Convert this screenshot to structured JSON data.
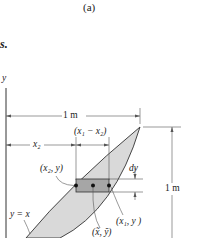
{
  "figure": {
    "caption": "(a)",
    "fragment_text": "s.",
    "axis_label_y": "y",
    "dim_width": "1 m",
    "dim_height": "1 m",
    "dim_x2": "x₂",
    "dim_x1_minus_x2": "(x₁ − x₂)",
    "dim_dy": "dy",
    "point_left": "(x₂, y)",
    "point_right": "(x₁, y )",
    "point_centroid": "(x̃, ỹ)",
    "curve_label": "y = x",
    "colors": {
      "region_fill": "#d9d9d9",
      "strip_fill": "#a6a6a6",
      "lines": "#333333",
      "dim_lines": "#555555"
    }
  }
}
